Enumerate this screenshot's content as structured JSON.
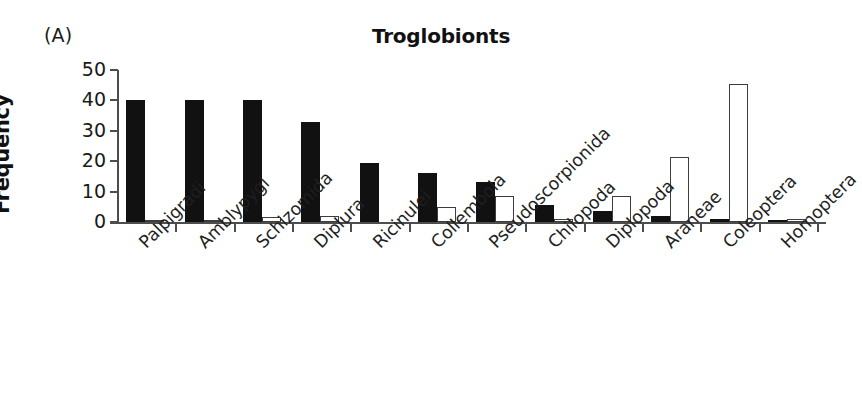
{
  "panel": {
    "label": "(A)"
  },
  "chart_data": {
    "type": "bar",
    "title": "Troglobionts",
    "xlabel": "",
    "ylabel": "Frequency",
    "ylim": [
      0,
      50
    ],
    "yticks": [
      0,
      10,
      20,
      30,
      40,
      50
    ],
    "ytick_labels": [
      "0",
      "10",
      "20",
      "30",
      "40",
      "50"
    ],
    "grid": false,
    "legend": "none",
    "categories": [
      "Palpigradi",
      "Amblypygi",
      "Schizomida",
      "Diplura",
      "Ricinulei",
      "Collembola",
      "Pseudoscorpionida",
      "Chilopoda",
      "Diplopoda",
      "Araneae",
      "Coleoptera",
      "Homoptera"
    ],
    "series": [
      {
        "name": "filled",
        "fill": "#111111",
        "style": "solid",
        "values": [
          40,
          40,
          40,
          33,
          19.5,
          16,
          13,
          5.5,
          3.5,
          2,
          1,
          0.3
        ]
      },
      {
        "name": "open",
        "fill": "#ffffff",
        "style": "hollow",
        "values": [
          0.3,
          0.8,
          1.5,
          2,
          0,
          5,
          8.5,
          1,
          8.5,
          21.5,
          45.5,
          1
        ]
      }
    ]
  }
}
